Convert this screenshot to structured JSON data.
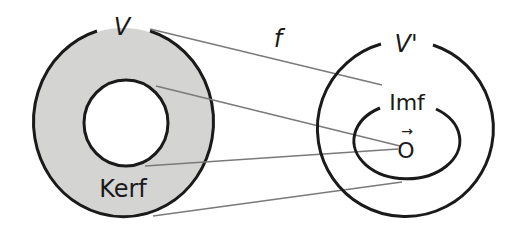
{
  "diagram": {
    "colors": {
      "stroke": "#1a1a1a",
      "kernel_fill": "#d4d4d2",
      "mapping_line": "#7a7a7a",
      "background": "#ffffff"
    },
    "domain": {
      "label": "V",
      "kernel_label": "Kerf"
    },
    "codomain": {
      "label": "V'",
      "image_label": "Imf",
      "zero_vector_label": "O",
      "zero_arrow": "→"
    },
    "map": {
      "label": "f"
    }
  }
}
